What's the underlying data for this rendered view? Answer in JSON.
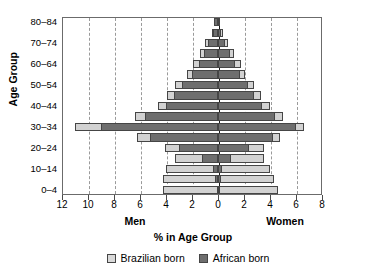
{
  "chart_data": {
    "type": "bar",
    "subtype": "population-pyramid",
    "title": "",
    "xlabel": "% in Age Group",
    "ylabel": "Age Group",
    "left_side_label": "Men",
    "right_side_label": "Women",
    "categories": [
      "0–4",
      "5–9",
      "10–14",
      "15–19",
      "20–24",
      "25–29",
      "30–34",
      "35–39",
      "40–44",
      "45–49",
      "50–54",
      "55–59",
      "60–64",
      "65–69",
      "70–74",
      "75–79",
      "80–84"
    ],
    "visible_tick_labels": [
      "0–4",
      "10–14",
      "20–24",
      "30–34",
      "40–44",
      "50–54",
      "60–64",
      "70–74",
      "80–84"
    ],
    "xtick_labels": [
      "12",
      "10",
      "8",
      "6",
      "4",
      "2",
      "0",
      "2",
      "4",
      "6",
      "8"
    ],
    "xtick_values": [
      -12,
      -10,
      -8,
      -6,
      -4,
      -2,
      0,
      2,
      4,
      6,
      8
    ],
    "xlim": [
      -12,
      8
    ],
    "xlabel_unit": "%",
    "grid": "vertical-dashed",
    "legend_position": "bottom-center",
    "legend": [
      {
        "name": "Brazilian born",
        "color": "#d9d9d9"
      },
      {
        "name": "African born",
        "color": "#6e6e6e"
      }
    ],
    "series": [
      {
        "name": "Men – African born",
        "side": "left",
        "group": "African born",
        "values": [
          0.1,
          0.2,
          0.4,
          1.2,
          3.0,
          5.2,
          9.0,
          5.6,
          4.0,
          3.4,
          2.8,
          2.0,
          1.5,
          1.1,
          0.8,
          0.4,
          0.3
        ]
      },
      {
        "name": "Men – Brazilian born (total bar)",
        "side": "left",
        "group": "Brazilian born",
        "values": [
          4.2,
          4.2,
          4.0,
          3.3,
          4.1,
          6.2,
          11.0,
          6.4,
          4.6,
          3.9,
          3.3,
          2.4,
          1.9,
          1.4,
          1.0,
          0.5,
          0.3
        ]
      },
      {
        "name": "Women – African born",
        "side": "right",
        "group": "African born",
        "values": [
          0.1,
          0.2,
          0.3,
          1.0,
          2.4,
          4.2,
          6.0,
          4.4,
          3.4,
          2.8,
          2.3,
          1.7,
          1.3,
          0.9,
          0.5,
          0.2,
          0.1
        ]
      },
      {
        "name": "Women – Brazilian born (total bar)",
        "side": "right",
        "group": "Brazilian born",
        "values": [
          4.6,
          4.3,
          4.0,
          3.5,
          3.5,
          4.8,
          6.6,
          5.0,
          4.0,
          3.3,
          2.8,
          2.1,
          1.8,
          1.2,
          0.8,
          0.4,
          0.1
        ]
      }
    ]
  },
  "legend": {
    "brazil_label": "Brazilian born",
    "africa_label": "African born"
  },
  "axes": {
    "y_title": "Age Group",
    "x_title": "% in Age Group",
    "men": "Men",
    "women": "Women"
  }
}
